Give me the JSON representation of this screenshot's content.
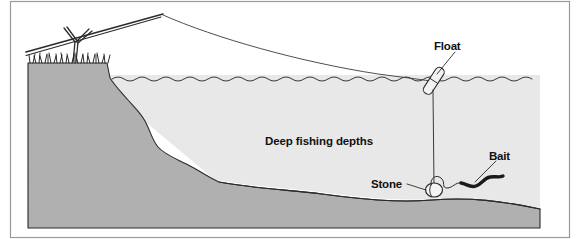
{
  "figure": {
    "kind": "cross-section-diagram",
    "frame": {
      "border_color": "#9a9a9a",
      "background_color": "#ffffff"
    }
  },
  "colors": {
    "ground": "#b0b0b0",
    "lakebed": "#b0b0b0",
    "water": "#e8e8e8",
    "outline": "#2b2b2b",
    "line": "#3a3a3a",
    "label": "#111111",
    "bait": "#1a1a1a",
    "float_fill": "#f2f2f2",
    "stone_fill": "#f4f4f4"
  },
  "labels": {
    "float": "Float",
    "bait": "Bait",
    "stone": "Stone",
    "depth_zone": "Deep fishing depths"
  },
  "elements": {
    "rod": "fishing-rod",
    "rod_rest": "forked-rod-rest-stick",
    "grass": "grass-tufts-on-bank",
    "fishing_line": "fishing-line",
    "float": "float",
    "stone": "stone-weight",
    "bait": "worm-bait",
    "water_surface": "water-surface-wave-line",
    "bank": "sloping-bank",
    "lakebed": "lake-bed"
  }
}
